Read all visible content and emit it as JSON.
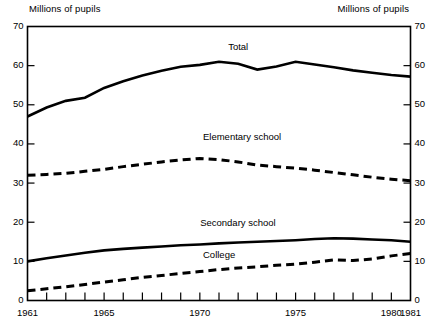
{
  "chart_data": {
    "type": "line",
    "title": "",
    "xlabel": "",
    "ylabel": "Millions of pupils",
    "ylabel_right": "Millions of pupils",
    "xlim": [
      1961,
      1981
    ],
    "ylim": [
      0,
      70
    ],
    "grid": false,
    "legend_position": "inline-annotations",
    "x": [
      1961,
      1962,
      1963,
      1964,
      1965,
      1966,
      1967,
      1968,
      1969,
      1970,
      1971,
      1972,
      1973,
      1974,
      1975,
      1976,
      1977,
      1978,
      1979,
      1980,
      1981
    ],
    "yticks": [
      0,
      10,
      20,
      30,
      40,
      50,
      60,
      70
    ],
    "xticks": [
      1961,
      1962,
      1963,
      1964,
      1965,
      1966,
      1967,
      1968,
      1969,
      1970,
      1971,
      1972,
      1973,
      1974,
      1975,
      1976,
      1977,
      1978,
      1979,
      1980,
      1981
    ],
    "xtick_labels": [
      {
        "x": 1961,
        "label": "1961"
      },
      {
        "x": 1965,
        "label": "1965"
      },
      {
        "x": 1970,
        "label": "1970"
      },
      {
        "x": 1975,
        "label": "1975"
      },
      {
        "x": 1980,
        "label": "1980"
      },
      {
        "x": 1981,
        "label": "1981"
      }
    ],
    "series": [
      {
        "name": "Total",
        "style": "solid",
        "color": "#000000",
        "label_x": 1972.0,
        "label_y": 64.5,
        "values": [
          47.0,
          49.3,
          51.0,
          51.8,
          54.3,
          56.0,
          57.5,
          58.7,
          59.7,
          60.2,
          61.0,
          60.5,
          59.0,
          59.8,
          61.0,
          60.3,
          59.6,
          58.8,
          58.2,
          57.6,
          57.2
        ]
      },
      {
        "name": "Elementary school",
        "style": "dashed",
        "color": "#000000",
        "label_x": 1972.2,
        "label_y": 41.5,
        "values": [
          32.0,
          32.2,
          32.5,
          33.0,
          33.5,
          34.2,
          34.8,
          35.4,
          35.9,
          36.3,
          36.0,
          35.4,
          34.6,
          34.2,
          33.8,
          33.3,
          32.7,
          32.1,
          31.5,
          31.0,
          30.6
        ]
      },
      {
        "name": "Secondary school",
        "style": "solid",
        "color": "#000000",
        "label_x": 1972.0,
        "label_y": 19.5,
        "values": [
          10.0,
          10.8,
          11.5,
          12.2,
          12.8,
          13.2,
          13.5,
          13.8,
          14.1,
          14.3,
          14.6,
          14.8,
          15.0,
          15.2,
          15.4,
          15.7,
          15.9,
          15.8,
          15.6,
          15.4,
          15.0
        ]
      },
      {
        "name": "College",
        "style": "dashed",
        "color": "#000000",
        "label_x": 1971.0,
        "label_y": 11.3,
        "values": [
          2.5,
          3.0,
          3.5,
          4.1,
          4.7,
          5.3,
          5.9,
          6.4,
          6.9,
          7.4,
          7.9,
          8.3,
          8.6,
          9.0,
          9.3,
          9.8,
          10.4,
          10.2,
          10.6,
          11.4,
          12.0
        ]
      }
    ]
  }
}
